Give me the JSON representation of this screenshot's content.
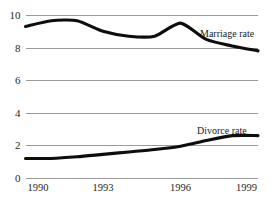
{
  "chart_data": {
    "type": "line",
    "title": "",
    "subtitle": "",
    "xlabel": "",
    "ylabel": "",
    "xlim": [
      1990,
      1999
    ],
    "ylim": [
      0,
      10
    ],
    "grid": true,
    "grid_axis": "y",
    "legend_position": "inline-right-of-series",
    "x": [
      1990,
      1991,
      1992,
      1993,
      1994,
      1995,
      1996,
      1997,
      1998,
      1999
    ],
    "xticks": [
      1990,
      1993,
      1996,
      1999
    ],
    "xtick_labels": [
      "1990",
      "1993",
      "1996",
      "1999"
    ],
    "yticks": [
      0,
      2,
      4,
      6,
      8,
      10
    ],
    "ytick_labels": [
      "0",
      "2",
      "4",
      "6",
      "8",
      "10"
    ],
    "series": [
      {
        "name": "Marriage rate",
        "label": "Marriage rate",
        "color": "#0d0d0d",
        "values": [
          9.3,
          9.65,
          9.65,
          9.0,
          8.7,
          8.7,
          9.5,
          8.5,
          8.1,
          7.8
        ]
      },
      {
        "name": "Divorce rate",
        "label": "Divorce rate",
        "color": "#0d0d0d",
        "values": [
          1.2,
          1.2,
          1.3,
          1.45,
          1.6,
          1.75,
          1.95,
          2.3,
          2.6,
          2.6
        ]
      }
    ]
  },
  "labels": {
    "marriage": "Marriage rate",
    "divorce": "Divorce rate"
  },
  "colors": {
    "line": "#0d0d0d",
    "grid": "#9a9a9a",
    "text": "#262626",
    "background": "#ffffff"
  }
}
